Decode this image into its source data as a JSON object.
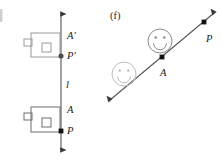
{
  "figure": {
    "width": 221,
    "height": 164,
    "background": "#ffffff"
  },
  "panels": [
    {
      "id": "panel-e",
      "label": "",
      "label_note": "panel letter cropped at left edge of image",
      "line": {
        "name": "l",
        "label": "l",
        "orientation": "vertical",
        "arrows": "both",
        "color": "#555555",
        "x": 61,
        "y_top": 14,
        "y_bottom": 150,
        "label_x": 66,
        "label_y": 88
      },
      "points": [
        {
          "name": "A-prime",
          "label": "A′",
          "x": 61,
          "y": 36,
          "dot": false,
          "label_x": 67,
          "label_y": 39
        },
        {
          "name": "P-prime",
          "label": "P′",
          "x": 61,
          "y": 56,
          "dot": true,
          "label_x": 67,
          "label_y": 59
        },
        {
          "name": "A",
          "label": "A",
          "x": 61,
          "y": 110,
          "dot": false,
          "label_x": 67,
          "label_y": 113
        },
        {
          "name": "P",
          "label": "P",
          "x": 61,
          "y": 131,
          "dot": true,
          "label_x": 67,
          "label_y": 134
        }
      ],
      "shapes": [
        {
          "name": "flag-shape-image",
          "description": "rectangle with inner square and left tab",
          "x": 31,
          "y": 33,
          "w": 29,
          "h": 24,
          "inner_square": {
            "x": 42,
            "y": 43,
            "w": 9,
            "h": 9
          },
          "tab": {
            "x": 24,
            "y": 39,
            "w": 8,
            "h": 7
          },
          "stroke": "#9a9a9a"
        },
        {
          "name": "flag-shape-preimage",
          "description": "rectangle with inner square and left tab",
          "x": 31,
          "y": 107,
          "w": 29,
          "h": 25,
          "inner_square": {
            "x": 42,
            "y": 118,
            "w": 9,
            "h": 9
          },
          "tab": {
            "x": 24,
            "y": 113,
            "w": 8,
            "h": 7
          },
          "stroke": "#6e6e6e"
        }
      ]
    },
    {
      "id": "panel-f",
      "label": "(f)",
      "label_x": 110,
      "label_y": 19,
      "line": {
        "name": "diagonal-line",
        "label": "",
        "orientation": "diagonal",
        "arrows": "both",
        "color": "#555555",
        "x1": 110,
        "y1": 100,
        "x2": 214,
        "y2": 13
      },
      "points": [
        {
          "name": "A",
          "label": "A",
          "x": 162,
          "y": 57,
          "dot": true,
          "label_x": 160,
          "label_y": 76
        },
        {
          "name": "P",
          "label": "P",
          "x": 204,
          "y": 22,
          "dot": true,
          "label_x": 206,
          "label_y": 42
        }
      ],
      "shapes": [
        {
          "name": "smiley-face-image",
          "description": "smiley face above the line",
          "cx": 160,
          "cy": 41,
          "r": 12,
          "stroke": "#8a8a8a",
          "eye_offset_x": 4.3,
          "eye_offset_y": 3.6,
          "eye_r": 1.25,
          "smile_r": 6.4
        },
        {
          "name": "smiley-face-preimage",
          "description": "smiley face below-left of the line",
          "cx": 124,
          "cy": 74,
          "r": 12,
          "stroke": "#bdbdbd",
          "eye_offset_x": 4.3,
          "eye_offset_y": 3.6,
          "eye_r": 1.25,
          "smile_r": 6.4
        }
      ]
    }
  ],
  "colors": {
    "line": "#555555",
    "point": "#111111",
    "text": "#1a1a1a",
    "shape_light": "#bdbdbd",
    "shape_mid": "#8a8a8a",
    "shape_dark": "#6e6e6e",
    "background": "#ffffff"
  }
}
